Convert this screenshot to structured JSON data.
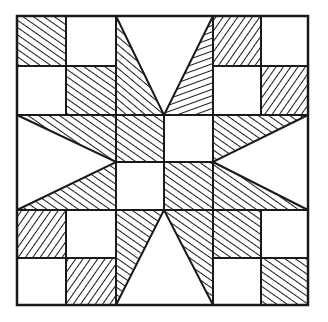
{
  "colors": {
    "ink": "#1a1a1a",
    "paper": "#ffffff"
  },
  "grid": {
    "cols": 6,
    "rows": 6,
    "x": [
      17,
      66,
      116,
      164,
      213,
      261,
      308
    ],
    "y": [
      16,
      66,
      115,
      162,
      210,
      258,
      305
    ]
  },
  "hatched_squares": [
    {
      "row": 0,
      "col": 0,
      "dir": "back"
    },
    {
      "row": 1,
      "col": 1,
      "dir": "back"
    },
    {
      "row": 0,
      "col": 4,
      "dir": "fwd"
    },
    {
      "row": 1,
      "col": 5,
      "dir": "fwd"
    },
    {
      "row": 4,
      "col": 0,
      "dir": "fwd"
    },
    {
      "row": 5,
      "col": 1,
      "dir": "fwd"
    },
    {
      "row": 4,
      "col": 4,
      "dir": "back"
    },
    {
      "row": 5,
      "col": 5,
      "dir": "back"
    },
    {
      "row": 2,
      "col": 2,
      "dir": "back"
    },
    {
      "row": 3,
      "col": 3,
      "dir": "back"
    }
  ],
  "star_points": [
    {
      "name": "top-left",
      "points": "116,16 116,115 164,115",
      "dir": "steep"
    },
    {
      "name": "top-right",
      "points": "213,16 213,115 164,115",
      "dir": "flat"
    },
    {
      "name": "left-upper",
      "points": "17,115 116,115 116,162",
      "dir": "back"
    },
    {
      "name": "left-lower",
      "points": "17,210 116,210 116,162",
      "dir": "back"
    },
    {
      "name": "right-upper",
      "points": "308,115 213,115 213,162",
      "dir": "back"
    },
    {
      "name": "right-lower",
      "points": "308,210 213,210 213,162",
      "dir": "back"
    },
    {
      "name": "bottom-left",
      "points": "116,210 164,210 116,305",
      "dir": "back"
    },
    {
      "name": "bottom-right",
      "points": "164,210 213,210 213,305",
      "dir": "back"
    }
  ]
}
